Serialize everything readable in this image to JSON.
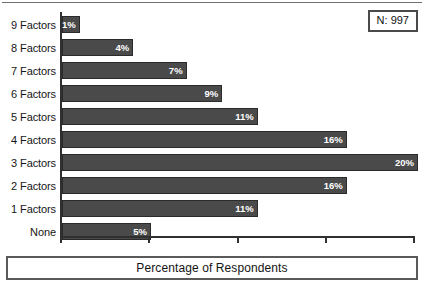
{
  "chart_data": {
    "type": "bar",
    "orientation": "horizontal",
    "title": "",
    "xlabel": "Percentage of Respondents",
    "ylabel": "",
    "categories": [
      "9 Factors",
      "8 Factors",
      "7 Factors",
      "6 Factors",
      "5 Factors",
      "4 Factors",
      "3 Factors",
      "2 Factors",
      "1 Factors",
      "None"
    ],
    "values": [
      1,
      4,
      7,
      9,
      11,
      16,
      20,
      16,
      11,
      5
    ],
    "value_labels": [
      "1%",
      "4%",
      "7%",
      "9%",
      "11%",
      "16%",
      "20%",
      "16%",
      "11%",
      "5%"
    ],
    "xlim": [
      0,
      20
    ],
    "xticks": [
      0,
      5,
      10,
      15,
      20
    ],
    "xtick_labels": [
      "",
      "",
      "",
      "",
      ""
    ],
    "grid": false,
    "legend": "N: 997",
    "legend_position": "top-right",
    "bar_color": "#4a4a4a",
    "bar_border_color": "#2b2b2b",
    "value_label_color": "#ffffff"
  },
  "annotation": {
    "n_label": "N: 997"
  },
  "axis_title": {
    "text": "Percentage of Respondents"
  },
  "bars": [
    {
      "label": "9 Factors",
      "value_label": "1%",
      "value": 1
    },
    {
      "label": "8 Factors",
      "value_label": "4%",
      "value": 4
    },
    {
      "label": "7 Factors",
      "value_label": "7%",
      "value": 7
    },
    {
      "label": "6 Factors",
      "value_label": "9%",
      "value": 9
    },
    {
      "label": "5 Factors",
      "value_label": "11%",
      "value": 11
    },
    {
      "label": "4 Factors",
      "value_label": "16%",
      "value": 16
    },
    {
      "label": "3 Factors",
      "value_label": "20%",
      "value": 20
    },
    {
      "label": "2 Factors",
      "value_label": "16%",
      "value": 16
    },
    {
      "label": "1 Factors",
      "value_label": "11%",
      "value": 11
    },
    {
      "label": "None",
      "value_label": "5%",
      "value": 5
    }
  ]
}
